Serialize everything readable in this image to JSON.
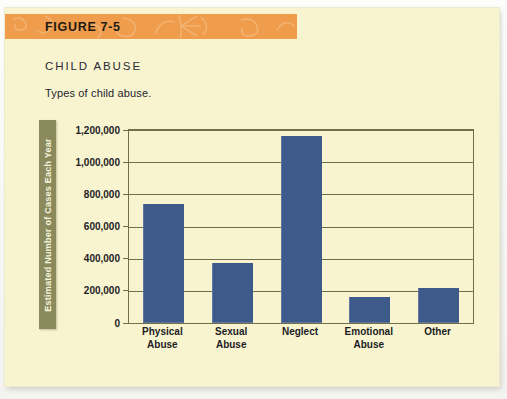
{
  "banner": {
    "figure_label": "FIGURE 7-5",
    "background_color": "#ef9c4d"
  },
  "headings": {
    "section_title": "CHILD ABUSE",
    "caption": "Types of child abuse."
  },
  "colors": {
    "page_background": "#f8f4cf",
    "bar_color": "#3d5a8b",
    "axis_color": "#6f6f4a",
    "yaxis_band_color": "#8a8a5c",
    "banner_color": "#ef9c4d"
  },
  "chart_data": {
    "type": "bar",
    "title": "CHILD ABUSE",
    "subtitle": "Types of child abuse.",
    "xlabel": "",
    "ylabel": "Estimated Number of Cases Each Year",
    "categories": [
      "Physical Abuse",
      "Sexual Abuse",
      "Neglect",
      "Emotional Abuse",
      "Other"
    ],
    "category_lines": [
      [
        "Physical",
        "Abuse"
      ],
      [
        "Sexual",
        "Abuse"
      ],
      [
        "Neglect",
        ""
      ],
      [
        "Emotional",
        "Abuse"
      ],
      [
        "Other",
        ""
      ]
    ],
    "values": [
      740000,
      375000,
      1160000,
      160000,
      215000
    ],
    "ylim": [
      0,
      1200000
    ],
    "ytick_values": [
      0,
      200000,
      400000,
      600000,
      800000,
      1000000,
      1200000
    ],
    "ytick_labels": [
      "0",
      "200,000",
      "400,000",
      "600,000",
      "800,000",
      "1,000,000",
      "1,200,000"
    ],
    "grid": true,
    "legend": null,
    "series_color": "#3d5a8b"
  }
}
